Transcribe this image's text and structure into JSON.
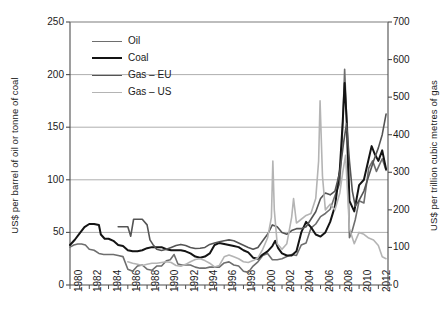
{
  "chart_data": {
    "type": "line",
    "title": "",
    "xlabel": "",
    "ylabel": "US$ per barrel of oil or tonne of coal",
    "y2label": "US$ per trillion cubic metres of gas",
    "xlim": [
      1980,
      2013
    ],
    "ylim": [
      0,
      250
    ],
    "y2lim": [
      0,
      700
    ],
    "grid": true,
    "legend_position": "upper-left-inside",
    "y_ticks": [
      0,
      50,
      100,
      150,
      200,
      250
    ],
    "y2_ticks": [
      0,
      100,
      200,
      300,
      400,
      500,
      600,
      700
    ],
    "x_ticks": [
      1980,
      1982,
      1984,
      1986,
      1988,
      1990,
      1992,
      1994,
      1996,
      1998,
      2000,
      2002,
      2004,
      2006,
      2008,
      2010,
      2012
    ],
    "series": [
      {
        "name": "Oil",
        "color": "#6e6e6e",
        "width": 1.6,
        "axis": "left",
        "points": [
          [
            1980.0,
            36
          ],
          [
            1980.4,
            38
          ],
          [
            1980.8,
            39
          ],
          [
            1981.2,
            39
          ],
          [
            1981.6,
            38
          ],
          [
            1982.0,
            34
          ],
          [
            1982.5,
            33
          ],
          [
            1983.0,
            30
          ],
          [
            1983.5,
            29
          ],
          [
            1984.0,
            29
          ],
          [
            1984.5,
            29
          ],
          [
            1985.0,
            28
          ],
          [
            1985.5,
            27
          ],
          [
            1986.0,
            15
          ],
          [
            1986.5,
            13
          ],
          [
            1987.0,
            18
          ],
          [
            1987.5,
            19
          ],
          [
            1988.0,
            15
          ],
          [
            1988.5,
            14
          ],
          [
            1989.0,
            18
          ],
          [
            1989.5,
            18
          ],
          [
            1990.0,
            23
          ],
          [
            1990.4,
            24
          ],
          [
            1990.8,
            29
          ],
          [
            1991.2,
            20
          ],
          [
            1991.6,
            19
          ],
          [
            1992.0,
            19
          ],
          [
            1992.5,
            19
          ],
          [
            1993.0,
            17
          ],
          [
            1993.5,
            16
          ],
          [
            1994.0,
            16
          ],
          [
            1994.5,
            17
          ],
          [
            1995.0,
            17
          ],
          [
            1995.5,
            17
          ],
          [
            1996.0,
            21
          ],
          [
            1996.5,
            22
          ],
          [
            1997.0,
            19
          ],
          [
            1997.5,
            18
          ],
          [
            1998.0,
            13
          ],
          [
            1998.5,
            12
          ],
          [
            1999.0,
            18
          ],
          [
            1999.5,
            22
          ],
          [
            2000.0,
            28
          ],
          [
            2000.5,
            30
          ],
          [
            2001.0,
            24
          ],
          [
            2001.5,
            24
          ],
          [
            2002.0,
            25
          ],
          [
            2002.5,
            27
          ],
          [
            2003.0,
            29
          ],
          [
            2003.5,
            28
          ],
          [
            2004.0,
            38
          ],
          [
            2004.5,
            40
          ],
          [
            2005.0,
            54
          ],
          [
            2005.5,
            58
          ],
          [
            2006.0,
            65
          ],
          [
            2006.5,
            68
          ],
          [
            2007.0,
            72
          ],
          [
            2007.5,
            85
          ],
          [
            2008.0,
            97
          ],
          [
            2008.25,
            140
          ],
          [
            2008.5,
            205
          ],
          [
            2008.7,
            160
          ],
          [
            2009.0,
            45
          ],
          [
            2009.3,
            52
          ],
          [
            2009.6,
            62
          ],
          [
            2010.0,
            80
          ],
          [
            2010.5,
            78
          ],
          [
            2011.0,
            111
          ],
          [
            2011.4,
            118
          ],
          [
            2011.8,
            108
          ],
          [
            2012.0,
            112
          ],
          [
            2012.4,
            120
          ],
          [
            2012.8,
            109
          ]
        ]
      },
      {
        "name": "Coal",
        "color": "#141414",
        "width": 2.0,
        "axis": "left",
        "points": [
          [
            1980.0,
            38
          ],
          [
            1980.5,
            43
          ],
          [
            1981.0,
            49
          ],
          [
            1981.5,
            55
          ],
          [
            1982.0,
            58
          ],
          [
            1982.5,
            58
          ],
          [
            1983.0,
            57
          ],
          [
            1983.2,
            48
          ],
          [
            1983.6,
            44
          ],
          [
            1984.0,
            44
          ],
          [
            1984.5,
            42
          ],
          [
            1985.0,
            38
          ],
          [
            1985.5,
            37
          ],
          [
            1986.0,
            33
          ],
          [
            1986.5,
            32
          ],
          [
            1987.0,
            32
          ],
          [
            1987.5,
            33
          ],
          [
            1988.0,
            35
          ],
          [
            1988.5,
            36
          ],
          [
            1989.0,
            36
          ],
          [
            1989.5,
            36
          ],
          [
            1990.0,
            34
          ],
          [
            1990.5,
            33
          ],
          [
            1991.0,
            33
          ],
          [
            1991.5,
            33
          ],
          [
            1992.0,
            32
          ],
          [
            1992.5,
            30
          ],
          [
            1993.0,
            27
          ],
          [
            1993.5,
            26
          ],
          [
            1994.0,
            27
          ],
          [
            1994.5,
            30
          ],
          [
            1995.0,
            38
          ],
          [
            1995.5,
            40
          ],
          [
            1996.0,
            39
          ],
          [
            1996.5,
            38
          ],
          [
            1997.0,
            37
          ],
          [
            1997.5,
            36
          ],
          [
            1998.0,
            33
          ],
          [
            1998.5,
            31
          ],
          [
            1999.0,
            26
          ],
          [
            1999.5,
            25
          ],
          [
            2000.0,
            29
          ],
          [
            2000.5,
            32
          ],
          [
            2001.0,
            37
          ],
          [
            2001.3,
            42
          ],
          [
            2001.6,
            35
          ],
          [
            2002.0,
            30
          ],
          [
            2002.5,
            28
          ],
          [
            2003.0,
            28
          ],
          [
            2003.5,
            32
          ],
          [
            2004.0,
            50
          ],
          [
            2004.5,
            60
          ],
          [
            2005.0,
            55
          ],
          [
            2005.5,
            48
          ],
          [
            2006.0,
            46
          ],
          [
            2006.5,
            50
          ],
          [
            2007.0,
            60
          ],
          [
            2007.5,
            75
          ],
          [
            2008.0,
            110
          ],
          [
            2008.3,
            155
          ],
          [
            2008.5,
            192
          ],
          [
            2008.75,
            150
          ],
          [
            2009.0,
            80
          ],
          [
            2009.5,
            70
          ],
          [
            2010.0,
            95
          ],
          [
            2010.5,
            100
          ],
          [
            2011.0,
            120
          ],
          [
            2011.3,
            132
          ],
          [
            2011.6,
            125
          ],
          [
            2012.0,
            118
          ],
          [
            2012.4,
            128
          ],
          [
            2012.8,
            110
          ]
        ]
      },
      {
        "name": "Gas – EU",
        "color": "#545454",
        "width": 1.6,
        "axis": "right",
        "points": [
          [
            1985.0,
            155
          ],
          [
            1985.5,
            155
          ],
          [
            1986.0,
            155
          ],
          [
            1986.3,
            130
          ],
          [
            1986.6,
            175
          ],
          [
            1987.0,
            175
          ],
          [
            1987.5,
            175
          ],
          [
            1988.0,
            160
          ],
          [
            1988.3,
            120
          ],
          [
            1988.6,
            108
          ],
          [
            1989.0,
            95
          ],
          [
            1989.5,
            92
          ],
          [
            1990.0,
            95
          ],
          [
            1990.5,
            100
          ],
          [
            1991.0,
            105
          ],
          [
            1991.5,
            108
          ],
          [
            1992.0,
            105
          ],
          [
            1992.5,
            100
          ],
          [
            1993.0,
            97
          ],
          [
            1993.5,
            98
          ],
          [
            1994.0,
            100
          ],
          [
            1994.5,
            108
          ],
          [
            1995.0,
            112
          ],
          [
            1995.5,
            115
          ],
          [
            1996.0,
            118
          ],
          [
            1996.5,
            120
          ],
          [
            1997.0,
            118
          ],
          [
            1997.5,
            112
          ],
          [
            1998.0,
            106
          ],
          [
            1998.5,
            100
          ],
          [
            1999.0,
            95
          ],
          [
            1999.5,
            100
          ],
          [
            2000.0,
            118
          ],
          [
            2000.5,
            135
          ],
          [
            2001.0,
            160
          ],
          [
            2001.5,
            155
          ],
          [
            2002.0,
            140
          ],
          [
            2002.5,
            135
          ],
          [
            2003.0,
            145
          ],
          [
            2003.5,
            150
          ],
          [
            2004.0,
            150
          ],
          [
            2004.5,
            155
          ],
          [
            2005.0,
            175
          ],
          [
            2005.5,
            195
          ],
          [
            2006.0,
            230
          ],
          [
            2006.5,
            245
          ],
          [
            2007.0,
            240
          ],
          [
            2007.5,
            250
          ],
          [
            2008.0,
            300
          ],
          [
            2008.4,
            380
          ],
          [
            2008.7,
            430
          ],
          [
            2009.0,
            330
          ],
          [
            2009.3,
            250
          ],
          [
            2009.6,
            210
          ],
          [
            2010.0,
            225
          ],
          [
            2010.5,
            250
          ],
          [
            2011.0,
            290
          ],
          [
            2011.5,
            330
          ],
          [
            2012.0,
            365
          ],
          [
            2012.4,
            400
          ],
          [
            2012.8,
            455
          ]
        ]
      },
      {
        "name": "Gas – US",
        "color": "#b4b4b4",
        "width": 1.6,
        "axis": "right",
        "points": [
          [
            1986.0,
            62
          ],
          [
            1986.5,
            58
          ],
          [
            1987.0,
            55
          ],
          [
            1987.5,
            52
          ],
          [
            1988.0,
            55
          ],
          [
            1988.5,
            58
          ],
          [
            1989.0,
            58
          ],
          [
            1989.5,
            60
          ],
          [
            1990.0,
            62
          ],
          [
            1990.5,
            60
          ],
          [
            1991.0,
            52
          ],
          [
            1991.5,
            50
          ],
          [
            1992.0,
            55
          ],
          [
            1992.5,
            62
          ],
          [
            1993.0,
            68
          ],
          [
            1993.5,
            70
          ],
          [
            1994.0,
            65
          ],
          [
            1994.5,
            58
          ],
          [
            1995.0,
            48
          ],
          [
            1995.5,
            52
          ],
          [
            1996.0,
            75
          ],
          [
            1996.5,
            80
          ],
          [
            1997.0,
            75
          ],
          [
            1997.5,
            70
          ],
          [
            1998.0,
            62
          ],
          [
            1998.5,
            60
          ],
          [
            1999.0,
            65
          ],
          [
            1999.5,
            72
          ],
          [
            2000.0,
            95
          ],
          [
            2000.5,
            125
          ],
          [
            2000.9,
            180
          ],
          [
            2001.05,
            330
          ],
          [
            2001.2,
            200
          ],
          [
            2001.5,
            110
          ],
          [
            2002.0,
            95
          ],
          [
            2002.5,
            110
          ],
          [
            2003.0,
            180
          ],
          [
            2003.2,
            230
          ],
          [
            2003.5,
            165
          ],
          [
            2004.0,
            175
          ],
          [
            2004.5,
            185
          ],
          [
            2005.0,
            190
          ],
          [
            2005.5,
            230
          ],
          [
            2005.8,
            330
          ],
          [
            2005.95,
            490
          ],
          [
            2006.2,
            290
          ],
          [
            2006.5,
            200
          ],
          [
            2007.0,
            215
          ],
          [
            2007.5,
            200
          ],
          [
            2008.0,
            245
          ],
          [
            2008.3,
            300
          ],
          [
            2008.6,
            345
          ],
          [
            2009.0,
            150
          ],
          [
            2009.5,
            110
          ],
          [
            2010.0,
            140
          ],
          [
            2010.5,
            135
          ],
          [
            2011.0,
            125
          ],
          [
            2011.5,
            120
          ],
          [
            2012.0,
            105
          ],
          [
            2012.4,
            75
          ],
          [
            2012.8,
            70
          ]
        ]
      }
    ]
  },
  "legend": {
    "items": [
      {
        "label": "Oil",
        "color": "#6e6e6e",
        "width": 1.6
      },
      {
        "label": "Coal",
        "color": "#141414",
        "width": 2.6
      },
      {
        "label": "Gas – EU",
        "color": "#545454",
        "width": 1.8
      },
      {
        "label": "Gas – US",
        "color": "#b4b4b4",
        "width": 1.6
      }
    ]
  },
  "axes": {
    "left_title": "US$ per barrel of oil or tonne of coal",
    "right_title": "US$ per trillion cubic metres of gas"
  },
  "style": {
    "grid_color": "#8c8c8c",
    "axis_color": "#4d4d4d",
    "background": "#ffffff"
  }
}
